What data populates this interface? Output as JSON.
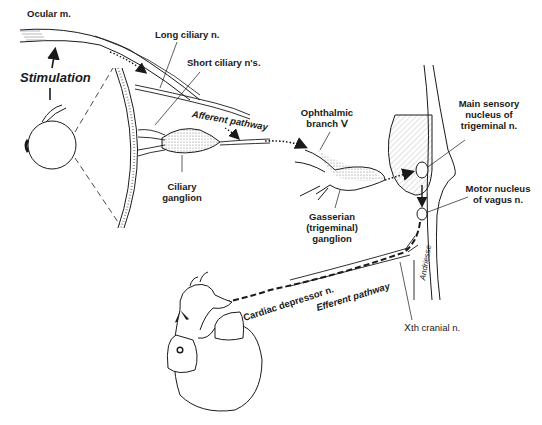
{
  "diagram": {
    "labels": {
      "ocular_muscle": "Ocular m.",
      "stimulation": "Stimulation",
      "long_ciliary": "Long ciliary n.",
      "short_ciliary": "Short ciliary n's.",
      "afferent_pathway": "Afferent pathway",
      "ciliary_ganglion_1": "Ciliary",
      "ciliary_ganglion_2": "ganglion",
      "ophthalmic_1": "Ophthalmic",
      "ophthalmic_2": "branch Ⅴ",
      "gasserian_1": "Gasserian",
      "gasserian_2": "(trigeminal)",
      "gasserian_3": "ganglion",
      "main_sensory_1": "Main sensory",
      "main_sensory_2": "nucleus of",
      "main_sensory_3": "trigeminal n.",
      "motor_vagus_1": "Motor nucleus",
      "motor_vagus_2": "of vagus n.",
      "cranial_x": "Ⅹth cranial n.",
      "cardiac_depressor": "Cardiac depressor n.",
      "efferent_pathway": "Efferent pathway",
      "signature": "Andriesse"
    },
    "colors": {
      "ink": "#1a1a1a",
      "stipple": "#888888"
    }
  }
}
